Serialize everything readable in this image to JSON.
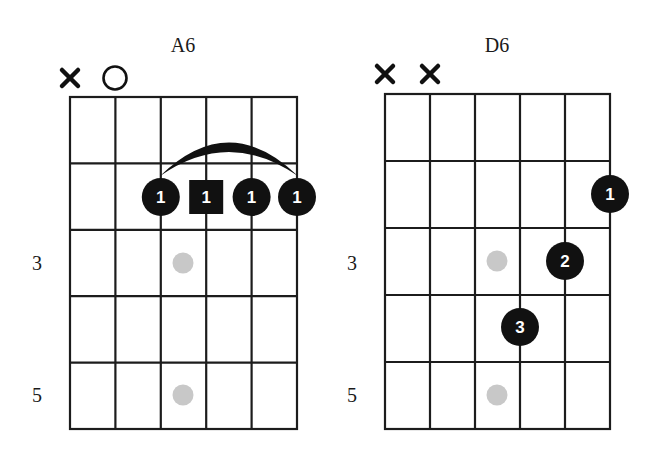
{
  "colors": {
    "ink": "#111111",
    "grid": "#1c1c1c",
    "inlay": "#c8c8c8",
    "finger_text": "#ffffff",
    "background": "#ffffff"
  },
  "chords": [
    {
      "name": "A6",
      "strings": 6,
      "frets_shown": 5,
      "fret_labels": [
        {
          "fret": 3,
          "label": "3"
        },
        {
          "fret": 5,
          "label": "5"
        }
      ],
      "string_markers": [
        {
          "string": 1,
          "type": "muted",
          "symbol": "×"
        },
        {
          "string": 2,
          "type": "open",
          "symbol": "○"
        }
      ],
      "barre": {
        "fret": 2,
        "from_string": 3,
        "to_string": 6,
        "finger": "1"
      },
      "fingers": [
        {
          "string": 3,
          "fret": 2,
          "finger": "1",
          "shape": "circle"
        },
        {
          "string": 4,
          "fret": 2,
          "finger": "1",
          "shape": "square",
          "root": true
        },
        {
          "string": 5,
          "fret": 2,
          "finger": "1",
          "shape": "circle"
        },
        {
          "string": 6,
          "fret": 2,
          "finger": "1",
          "shape": "circle"
        }
      ],
      "inlays": [
        {
          "fret": 3
        },
        {
          "fret": 5
        }
      ]
    },
    {
      "name": "D6",
      "strings": 6,
      "frets_shown": 5,
      "fret_labels": [
        {
          "fret": 3,
          "label": "3"
        },
        {
          "fret": 5,
          "label": "5"
        }
      ],
      "string_markers": [
        {
          "string": 1,
          "type": "muted",
          "symbol": "×"
        },
        {
          "string": 2,
          "type": "muted",
          "symbol": "×"
        }
      ],
      "barre": null,
      "fingers": [
        {
          "string": 6,
          "fret": 2,
          "finger": "1",
          "shape": "circle"
        },
        {
          "string": 5,
          "fret": 3,
          "finger": "2",
          "shape": "circle"
        },
        {
          "string": 4,
          "fret": 4,
          "finger": "3",
          "shape": "circle"
        }
      ],
      "inlays": [
        {
          "fret": 3
        },
        {
          "fret": 5
        }
      ]
    }
  ]
}
